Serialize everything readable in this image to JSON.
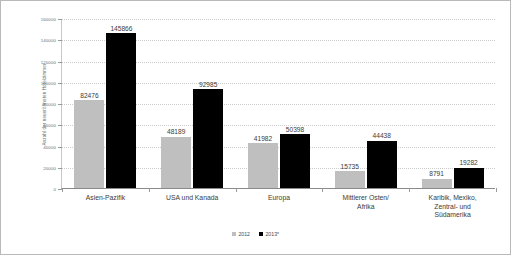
{
  "chart_data": {
    "type": "bar",
    "title": "",
    "subtitle": "",
    "xlabel": "",
    "ylabel": "Anzahl der neueröffneten Hotelzimmer",
    "ylim": [
      0,
      160000
    ],
    "ytick_step": 20000,
    "yticks": [
      0,
      20000,
      40000,
      60000,
      80000,
      100000,
      120000,
      140000,
      160000
    ],
    "ytick_labels": [
      "0",
      "20000",
      "40000",
      "60000",
      "80000",
      "100000",
      "120000",
      "140000",
      "160000"
    ],
    "grid": true,
    "grid_axis": "y",
    "legend_position": "bottom",
    "categories": [
      "Asien-Pazifik",
      "USA und Kanada",
      "Europa",
      "Mittlerer Osten/\nAfrika",
      "Karibik, Mexiko,\nZentral- und\nSüdamerika"
    ],
    "series": [
      {
        "name": "2012",
        "color": "#bfbfbf",
        "values": [
          82476,
          48189,
          41982,
          15735,
          8791
        ],
        "value_labels": [
          "82476",
          "48189",
          "41982",
          "15735",
          "8791"
        ]
      },
      {
        "name": "2013*",
        "color": "#000000",
        "values": [
          145866,
          92985,
          50398,
          44438,
          19282
        ],
        "value_labels": [
          "145866",
          "92985",
          "50398",
          "44438",
          "19282"
        ]
      }
    ]
  },
  "legend": {
    "items": [
      {
        "label": "2012",
        "color": "#bfbfbf"
      },
      {
        "label": "2013*",
        "color": "#000000"
      }
    ]
  },
  "colors": {
    "series_2012": "#bfbfbf",
    "series_2013": "#000000",
    "frame_border": "#b9b9b9",
    "axis_line": "#8a8a8a",
    "gridline": "#cccccc",
    "background": "#ffffff",
    "label_text": "#3b3b3b",
    "tick_text": "#6d6d6d"
  }
}
